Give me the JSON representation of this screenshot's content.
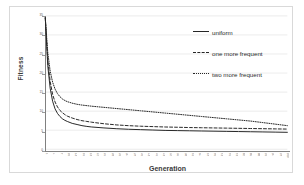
{
  "chart_data": {
    "type": "line",
    "title": "",
    "xlabel": "Generation",
    "ylabel": "Fitness",
    "grid": true,
    "legend_position": "top-right",
    "ylim": [
      0,
      35
    ],
    "yticks": [
      0,
      5,
      10,
      15,
      20,
      25,
      30,
      35
    ],
    "ytick_labels": [
      "0",
      "5",
      "10",
      "15",
      "20",
      "25",
      "30",
      "35"
    ],
    "xlim": [
      1,
      100
    ],
    "x": [
      1,
      2,
      3,
      4,
      5,
      6,
      7,
      8,
      9,
      10,
      12,
      14,
      16,
      18,
      20,
      25,
      30,
      35,
      40,
      45,
      50,
      55,
      60,
      65,
      70,
      75,
      80,
      85,
      90,
      95,
      100
    ],
    "xtick_labels": [
      "1",
      "4",
      "7",
      "10",
      "13",
      "16",
      "19",
      "22",
      "25",
      "28",
      "31",
      "34",
      "37",
      "40",
      "43",
      "46",
      "49",
      "52",
      "55",
      "58",
      "61",
      "64",
      "67",
      "70",
      "73",
      "76",
      "79",
      "82",
      "85",
      "88",
      "91",
      "94",
      "97",
      "100"
    ],
    "series": [
      {
        "name": "uniform",
        "style": "solid",
        "color": "#262626",
        "values": [
          34.5,
          22.0,
          16.0,
          12.6,
          10.6,
          9.4,
          8.6,
          8.0,
          7.6,
          7.3,
          6.8,
          6.5,
          6.2,
          6.0,
          5.85,
          5.6,
          5.4,
          5.25,
          5.15,
          5.05,
          4.95,
          4.9,
          4.85,
          4.8,
          4.75,
          4.7,
          4.65,
          4.6,
          4.55,
          4.5,
          4.45
        ]
      },
      {
        "name": "one more frequent",
        "style": "dashed",
        "color": "#262626",
        "values": [
          34.5,
          23.5,
          17.8,
          14.4,
          12.4,
          11.1,
          10.2,
          9.6,
          9.1,
          8.7,
          8.2,
          7.8,
          7.5,
          7.3,
          7.1,
          6.7,
          6.4,
          6.2,
          6.05,
          5.95,
          5.85,
          5.78,
          5.7,
          5.65,
          5.6,
          5.55,
          5.5,
          5.45,
          5.4,
          5.35,
          5.3
        ]
      },
      {
        "name": "two more frequent",
        "style": "dotted",
        "color": "#262626",
        "values": [
          34.5,
          25.5,
          20.5,
          17.6,
          15.8,
          14.6,
          13.8,
          13.2,
          12.8,
          12.5,
          12.1,
          11.8,
          11.6,
          11.45,
          11.3,
          11.0,
          10.7,
          10.4,
          10.1,
          9.8,
          9.5,
          9.2,
          8.9,
          8.6,
          8.3,
          8.0,
          7.7,
          7.4,
          7.0,
          6.6,
          6.2
        ]
      }
    ]
  },
  "legend": {
    "items": [
      {
        "label": "uniform"
      },
      {
        "label": "one more frequent"
      },
      {
        "label": "two more frequent"
      }
    ]
  },
  "axis": {
    "x_title": "Generation",
    "y_title": "Fitness"
  }
}
